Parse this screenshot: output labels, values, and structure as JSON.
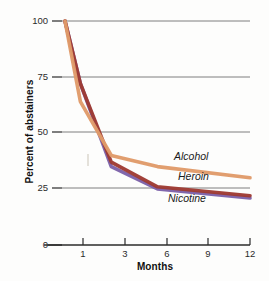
{
  "chart_data": {
    "type": "line",
    "title": "",
    "xlabel": "Months",
    "ylabel": "Percent of abstainers",
    "x": [
      0,
      1,
      3,
      6,
      12
    ],
    "xtick_labels": [
      "1",
      "3",
      "6",
      "9",
      "12"
    ],
    "xtick_values": [
      1,
      3,
      6,
      9,
      12
    ],
    "ytick_labels": [
      "0",
      "25",
      "50",
      "75",
      "100"
    ],
    "ytick_values": [
      0,
      25,
      50,
      75,
      100
    ],
    "xlim": [
      0,
      12
    ],
    "ylim": [
      0,
      100
    ],
    "grid": "horizontal",
    "legend": "inline-labels",
    "series": [
      {
        "name": "Alcohol",
        "color": "#e09b6a",
        "x": [
          0,
          1,
          3,
          6,
          12
        ],
        "values": [
          100,
          64,
          40,
          35,
          30
        ]
      },
      {
        "name": "Heroin",
        "color": "#9e3a32",
        "x": [
          0,
          1,
          3,
          6,
          12
        ],
        "values": [
          100,
          72,
          37,
          26,
          22
        ]
      },
      {
        "name": "Nicotine",
        "color": "#7a5fa8",
        "x": [
          0,
          1,
          3,
          6,
          12
        ],
        "values": [
          100,
          72,
          35,
          25,
          21
        ]
      }
    ]
  },
  "axes": {
    "y_title": "Percent of abstainers",
    "x_title": "Months",
    "y_ticks": [
      {
        "label": "100"
      },
      {
        "label": "75"
      },
      {
        "label": "50"
      },
      {
        "label": "25"
      },
      {
        "label": "0"
      }
    ],
    "x_ticks": [
      {
        "label": "1"
      },
      {
        "label": "3"
      },
      {
        "label": "6"
      },
      {
        "label": "9"
      },
      {
        "label": "12"
      }
    ]
  },
  "series_labels": {
    "alcohol": "Alcohol",
    "heroin": "Heroin",
    "nicotine": "Nicotine"
  },
  "colors": {
    "alcohol": "#e09b6a",
    "heroin": "#9e3a32",
    "nicotine": "#7a5fa8",
    "gridline": "#7e7e7e",
    "axis": "#2b2b2b",
    "background": "#fdfdfc"
  }
}
